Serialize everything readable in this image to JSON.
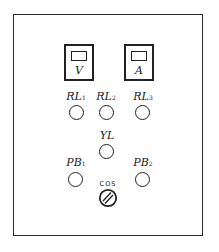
{
  "panel": {
    "meters": [
      {
        "id": "voltmeter",
        "label": "V"
      },
      {
        "id": "ammeter",
        "label": "A"
      }
    ],
    "indicator_lamps": [
      {
        "id": "RL1",
        "base": "RL",
        "sub": "1"
      },
      {
        "id": "RL2",
        "base": "RL",
        "sub": "2"
      },
      {
        "id": "RL3",
        "base": "RL",
        "sub": "3"
      },
      {
        "id": "YL",
        "base": "YL",
        "sub": ""
      }
    ],
    "push_buttons": [
      {
        "id": "PB1",
        "base": "PB",
        "sub": "1"
      },
      {
        "id": "PB2",
        "base": "PB",
        "sub": "2"
      }
    ],
    "selector_switch": {
      "id": "COS",
      "label": "COS"
    }
  }
}
